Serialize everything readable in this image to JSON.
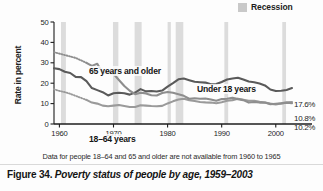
{
  "figure": {
    "number_label": "Figure 34.",
    "title": "Poverty status of people by age, 1959–2003",
    "footnote": "Data for people 18–64 and 65 and older are not available from 1960 to 1965"
  },
  "legend": {
    "recession_label": "Recession",
    "recession_color": "#c9c9c9"
  },
  "annotations": {
    "series_65": "65 years and older",
    "series_under18": "Under 18 years",
    "series_1864": "18–64 years",
    "end_under18": "17.6%",
    "end_1864": "10.8%",
    "end_65": "10.2%"
  },
  "colors": {
    "under18_line": "#5a5a5a",
    "age1864_line": "#9a9a9a",
    "age65_line": "#8e8e8e",
    "recession_band": "#dcdcdc",
    "axis": "#1d1d1d"
  },
  "chart_data": {
    "type": "line",
    "title": "Poverty status of people by age, 1959–2003",
    "xlabel": "",
    "ylabel": "Rate in percent",
    "xlim": [
      1959,
      2003
    ],
    "ylim": [
      0,
      50
    ],
    "ytick_labels": [
      "0",
      "10",
      "20",
      "30",
      "40",
      "50"
    ],
    "yticks": [
      0,
      10,
      20,
      30,
      40,
      50
    ],
    "xtick_labels": [
      "1960",
      "1970",
      "1980",
      "1990",
      "2000"
    ],
    "xticks": [
      1960,
      1970,
      1980,
      1990,
      2000
    ],
    "grid": false,
    "legend_position": "top-right",
    "x": [
      1959,
      1960,
      1961,
      1962,
      1963,
      1964,
      1965,
      1966,
      1967,
      1968,
      1969,
      1970,
      1971,
      1972,
      1973,
      1974,
      1975,
      1976,
      1977,
      1978,
      1979,
      1980,
      1981,
      1982,
      1983,
      1984,
      1985,
      1986,
      1987,
      1988,
      1989,
      1990,
      1991,
      1992,
      1993,
      1994,
      1995,
      1996,
      1997,
      1998,
      1999,
      2000,
      2001,
      2002,
      2003
    ],
    "series": [
      {
        "name": "Under 18 years",
        "color": "#5a5a5a",
        "end_value_label": "17.6%",
        "values": [
          27.3,
          26.9,
          25.6,
          25.0,
          23.1,
          23.0,
          21.0,
          17.6,
          16.6,
          15.6,
          14.0,
          15.1,
          15.3,
          15.1,
          14.4,
          15.4,
          17.1,
          16.0,
          16.2,
          15.9,
          16.4,
          18.3,
          20.0,
          21.9,
          22.3,
          21.5,
          20.7,
          20.5,
          20.3,
          19.5,
          19.6,
          20.6,
          21.8,
          22.3,
          22.7,
          21.8,
          20.8,
          20.5,
          19.9,
          18.9,
          16.9,
          16.2,
          16.3,
          16.7,
          17.6
        ]
      },
      {
        "name": "18–64 years",
        "color": "#9a9a9a",
        "end_value_label": "10.8%",
        "dashed_range": [
          1959,
          1965
        ],
        "values": [
          17.0,
          16.2,
          15.6,
          14.8,
          13.8,
          12.8,
          11.8,
          10.5,
          10.0,
          9.0,
          8.7,
          9.0,
          9.3,
          8.8,
          8.3,
          8.3,
          9.2,
          9.0,
          8.8,
          8.7,
          8.9,
          10.1,
          11.1,
          12.0,
          12.4,
          11.7,
          11.3,
          10.8,
          10.6,
          10.5,
          10.2,
          10.7,
          11.4,
          11.7,
          12.4,
          11.9,
          11.4,
          11.4,
          10.9,
          10.5,
          10.0,
          9.6,
          10.1,
          10.6,
          10.8
        ]
      },
      {
        "name": "65 years and older",
        "color": "#8e8e8e",
        "end_value_label": "10.2%",
        "dashed_range": [
          1959,
          1965
        ],
        "values": [
          35.2,
          34.5,
          33.8,
          33.1,
          32.4,
          31.2,
          30.0,
          28.5,
          29.5,
          25.0,
          25.3,
          24.6,
          21.6,
          18.6,
          16.3,
          14.6,
          15.3,
          15.0,
          14.1,
          14.0,
          15.2,
          15.7,
          15.3,
          14.6,
          13.8,
          12.4,
          12.6,
          12.4,
          12.5,
          12.0,
          11.4,
          12.2,
          12.4,
          12.9,
          12.2,
          11.7,
          10.5,
          10.8,
          10.5,
          10.5,
          9.7,
          9.9,
          10.1,
          10.4,
          10.2
        ]
      }
    ],
    "recession_bands": [
      {
        "start": 1960.3,
        "end": 1961.2
      },
      {
        "start": 1969.9,
        "end": 1970.9
      },
      {
        "start": 1973.9,
        "end": 1975.2
      },
      {
        "start": 1980.0,
        "end": 1980.6
      },
      {
        "start": 1981.5,
        "end": 1982.9
      },
      {
        "start": 1990.5,
        "end": 1991.2
      },
      {
        "start": 2001.2,
        "end": 2001.9
      }
    ]
  }
}
